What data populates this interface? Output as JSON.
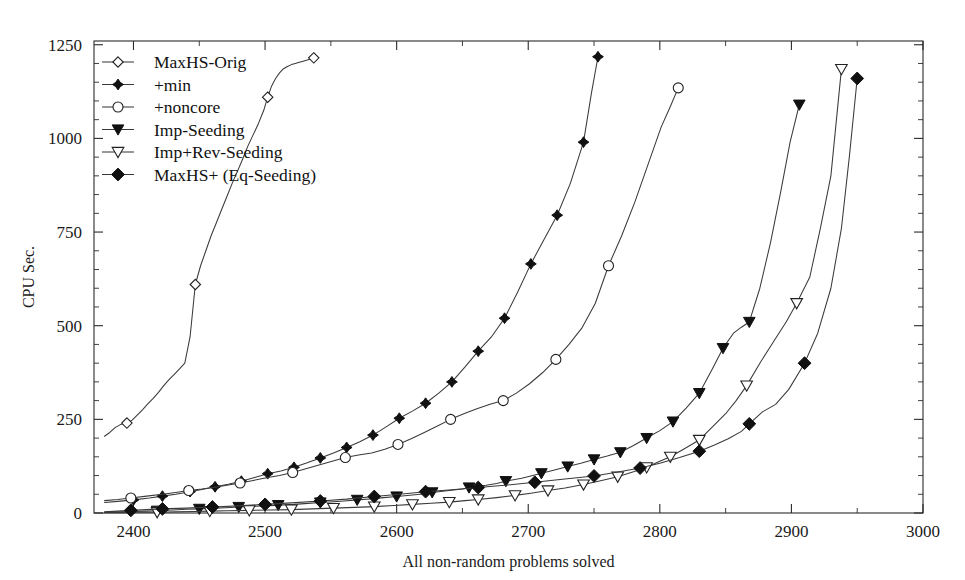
{
  "chart_data": {
    "type": "line",
    "title": "",
    "xlabel": "All non-random problems solved",
    "ylabel": "CPU Sec.",
    "xlim": [
      2370,
      3000
    ],
    "ylim": [
      0,
      1260
    ],
    "x_ticks": [
      2400,
      2500,
      2600,
      2700,
      2800,
      2900,
      3000
    ],
    "x_tick_labels": [
      "2400",
      "2500",
      "2600",
      "2700",
      "2800",
      "2900",
      "3000"
    ],
    "x_minor_ticks": [
      2450,
      2550,
      2650,
      2750,
      2850,
      2950
    ],
    "y_ticks": [
      0,
      250,
      500,
      750,
      1000,
      1250
    ],
    "y_tick_labels": [
      "0",
      "250",
      "500",
      "750",
      "1000",
      "1250"
    ],
    "y_minor_ticks": [
      50,
      100,
      150,
      200,
      300,
      350,
      400,
      450,
      550,
      600,
      650,
      700,
      800,
      850,
      900,
      950,
      1050,
      1100,
      1150,
      1200
    ],
    "grid": false,
    "legend_position": "upper-left",
    "line_color": "#3a3a3a",
    "marker_fill_color": "#111111",
    "marker_open_color": "#ffffff",
    "series": [
      {
        "name": "MaxHS-Orig",
        "marker": "diamond-open",
        "marker_every_x": [
          2395,
          2447,
          2502,
          2537
        ],
        "x": [
          2378,
          2382,
          2386,
          2390,
          2395,
          2399,
          2403,
          2407,
          2411,
          2415,
          2419,
          2423,
          2427,
          2431,
          2435,
          2439,
          2443,
          2447,
          2451,
          2455,
          2459,
          2463,
          2467,
          2471,
          2475,
          2479,
          2483,
          2487,
          2491,
          2495,
          2499,
          2502,
          2505,
          2508,
          2511,
          2514,
          2517,
          2520,
          2523,
          2526,
          2529,
          2532,
          2535,
          2537
        ],
        "y": [
          205,
          215,
          228,
          236,
          240,
          248,
          262,
          276,
          292,
          306,
          322,
          340,
          356,
          370,
          385,
          400,
          470,
          610,
          660,
          700,
          740,
          775,
          810,
          845,
          880,
          912,
          945,
          980,
          1010,
          1040,
          1075,
          1110,
          1140,
          1160,
          1175,
          1186,
          1192,
          1197,
          1200,
          1203,
          1206,
          1209,
          1212,
          1215
        ]
      },
      {
        "name": "+min",
        "marker": "diamond-small-filled",
        "marker_every_x": [
          2400,
          2422,
          2443,
          2462,
          2482,
          2502,
          2522,
          2542,
          2562,
          2582,
          2602,
          2622,
          2642,
          2662,
          2682,
          2702,
          2722,
          2742,
          2753
        ],
        "x": [
          2378,
          2388,
          2400,
          2412,
          2422,
          2432,
          2443,
          2452,
          2462,
          2472,
          2482,
          2492,
          2502,
          2512,
          2522,
          2532,
          2542,
          2552,
          2562,
          2572,
          2582,
          2592,
          2602,
          2612,
          2622,
          2632,
          2642,
          2652,
          2662,
          2672,
          2682,
          2692,
          2702,
          2712,
          2722,
          2732,
          2742,
          2748,
          2753
        ],
        "y": [
          28,
          31,
          35,
          40,
          45,
          50,
          57,
          63,
          70,
          77,
          85,
          95,
          105,
          112,
          122,
          134,
          147,
          160,
          175,
          190,
          208,
          230,
          253,
          272,
          293,
          320,
          350,
          390,
          432,
          470,
          520,
          590,
          665,
          730,
          795,
          880,
          990,
          1120,
          1218
        ]
      },
      {
        "name": "+noncore",
        "marker": "circle-open",
        "marker_every_x": [
          2398,
          2442,
          2481,
          2521,
          2561,
          2601,
          2641,
          2681,
          2721,
          2761,
          2814
        ],
        "x": [
          2378,
          2388,
          2398,
          2410,
          2422,
          2432,
          2442,
          2452,
          2462,
          2471,
          2481,
          2491,
          2501,
          2511,
          2521,
          2531,
          2541,
          2551,
          2561,
          2571,
          2581,
          2591,
          2601,
          2611,
          2621,
          2631,
          2641,
          2651,
          2661,
          2671,
          2681,
          2691,
          2701,
          2711,
          2721,
          2731,
          2741,
          2751,
          2761,
          2771,
          2781,
          2791,
          2801,
          2808,
          2814
        ],
        "y": [
          33,
          36,
          40,
          45,
          50,
          55,
          60,
          64,
          69,
          74,
          80,
          87,
          94,
          100,
          108,
          118,
          128,
          138,
          148,
          155,
          160,
          170,
          183,
          198,
          215,
          232,
          250,
          265,
          278,
          290,
          300,
          320,
          345,
          375,
          410,
          450,
          495,
          560,
          660,
          740,
          830,
          930,
          1030,
          1085,
          1135
        ]
      },
      {
        "name": "Imp-Seeding",
        "marker": "triangle-down-filled",
        "marker_every_x": [
          2418,
          2450,
          2480,
          2510,
          2542,
          2570,
          2600,
          2627,
          2655,
          2683,
          2710,
          2730,
          2750,
          2770,
          2790,
          2810,
          2830,
          2848,
          2868,
          2906
        ],
        "x": [
          2378,
          2390,
          2400,
          2410,
          2418,
          2430,
          2440,
          2450,
          2462,
          2470,
          2480,
          2492,
          2500,
          2510,
          2522,
          2530,
          2542,
          2552,
          2560,
          2570,
          2582,
          2590,
          2600,
          2612,
          2620,
          2627,
          2640,
          2650,
          2655,
          2668,
          2676,
          2683,
          2695,
          2702,
          2710,
          2720,
          2730,
          2740,
          2750,
          2760,
          2770,
          2780,
          2790,
          2800,
          2810,
          2820,
          2830,
          2840,
          2848,
          2856,
          2862,
          2868,
          2876,
          2884,
          2892,
          2899,
          2906
        ],
        "y": [
          2,
          3,
          4,
          5,
          6,
          8,
          10,
          11,
          13,
          14,
          16,
          18,
          19,
          21,
          23,
          25,
          28,
          30,
          32,
          35,
          38,
          41,
          44,
          48,
          51,
          55,
          60,
          64,
          68,
          74,
          79,
          85,
          93,
          99,
          106,
          115,
          124,
          133,
          143,
          152,
          162,
          180,
          200,
          220,
          244,
          280,
          320,
          385,
          440,
          480,
          496,
          510,
          600,
          720,
          860,
          990,
          1090
        ]
      },
      {
        "name": "Imp+Rev-Seeding",
        "marker": "triangle-down-open",
        "marker_every_x": [
          2418,
          2458,
          2488,
          2520,
          2552,
          2583,
          2612,
          2640,
          2662,
          2690,
          2715,
          2742,
          2768,
          2790,
          2808,
          2830,
          2866,
          2904,
          2938
        ],
        "x": [
          2378,
          2392,
          2404,
          2418,
          2432,
          2446,
          2458,
          2472,
          2488,
          2504,
          2520,
          2536,
          2552,
          2568,
          2583,
          2598,
          2612,
          2626,
          2640,
          2652,
          2662,
          2676,
          2690,
          2702,
          2715,
          2728,
          2742,
          2755,
          2768,
          2780,
          2790,
          2800,
          2808,
          2818,
          2830,
          2840,
          2850,
          2858,
          2866,
          2876,
          2886,
          2896,
          2904,
          2914,
          2922,
          2930,
          2938
        ],
        "y": [
          1,
          1,
          2,
          2,
          3,
          4,
          5,
          6,
          7,
          8,
          9,
          11,
          13,
          15,
          17,
          20,
          23,
          26,
          29,
          33,
          36,
          41,
          47,
          53,
          60,
          67,
          76,
          86,
          97,
          110,
          122,
          138,
          150,
          170,
          195,
          230,
          265,
          300,
          340,
          400,
          455,
          510,
          560,
          630,
          760,
          900,
          1185
        ]
      },
      {
        "name": "MaxHS+ (Eq-Seeding)",
        "marker": "diamond-filled",
        "marker_every_x": [
          2398,
          2422,
          2460,
          2500,
          2542,
          2583,
          2622,
          2662,
          2705,
          2750,
          2785,
          2830,
          2868,
          2910,
          2950
        ],
        "x": [
          2378,
          2388,
          2398,
          2410,
          2422,
          2440,
          2460,
          2480,
          2500,
          2520,
          2542,
          2562,
          2583,
          2602,
          2622,
          2642,
          2662,
          2682,
          2705,
          2726,
          2750,
          2766,
          2785,
          2800,
          2815,
          2830,
          2842,
          2852,
          2862,
          2868,
          2878,
          2888,
          2898,
          2910,
          2920,
          2930,
          2938,
          2944,
          2950
        ],
        "y": [
          3,
          5,
          7,
          9,
          11,
          13,
          16,
          19,
          23,
          27,
          32,
          37,
          44,
          50,
          57,
          62,
          68,
          74,
          82,
          90,
          99,
          108,
          120,
          133,
          148,
          165,
          182,
          198,
          218,
          238,
          270,
          290,
          330,
          400,
          480,
          600,
          760,
          950,
          1160
        ]
      }
    ]
  },
  "legend": {
    "entries": [
      {
        "label": "MaxHS-Orig",
        "marker": "diamond-open"
      },
      {
        "label": "+min",
        "marker": "diamond-small-filled"
      },
      {
        "label": "+noncore",
        "marker": "circle-open"
      },
      {
        "label": "Imp-Seeding",
        "marker": "triangle-down-filled"
      },
      {
        "label": "Imp+Rev-Seeding",
        "marker": "triangle-down-open"
      },
      {
        "label": "MaxHS+ (Eq-Seeding)",
        "marker": "diamond-filled"
      }
    ]
  }
}
